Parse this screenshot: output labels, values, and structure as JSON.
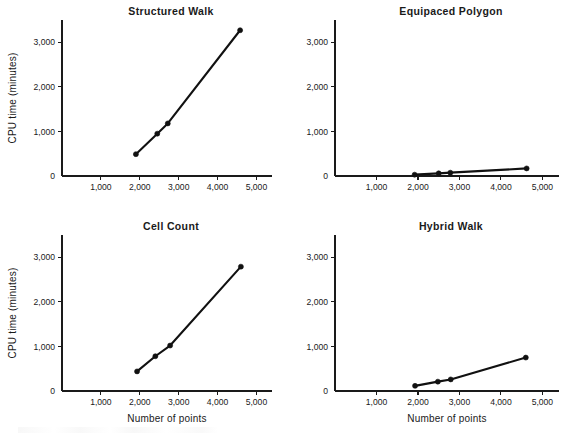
{
  "figure": {
    "background_color": "#ffffff",
    "ink_color": "#111111",
    "panel_count": 4
  },
  "chart_data": [
    {
      "type": "line",
      "title": "Structured Walk",
      "xlabel": "",
      "ylabel": "CPU time (minutes)",
      "xlim": [
        0,
        5400
      ],
      "ylim": [
        0,
        3500
      ],
      "xticks": [
        1000,
        2000,
        3000,
        4000,
        5000
      ],
      "xticklabels": [
        "1,000",
        "2,000",
        "3,000",
        "4,000",
        "5,000"
      ],
      "yticks": [
        0,
        1000,
        2000,
        3000
      ],
      "yticklabels": [
        "0",
        "1,000",
        "2,000",
        "3,000"
      ],
      "grid": false,
      "legend": false,
      "marker": "filled-circle",
      "x": [
        1900,
        2450,
        2720,
        4580
      ],
      "y": [
        490,
        950,
        1180,
        3270
      ]
    },
    {
      "type": "line",
      "title": "Equipaced Polygon",
      "xlabel": "",
      "ylabel": "",
      "xlim": [
        0,
        5400
      ],
      "ylim": [
        0,
        3500
      ],
      "xticks": [
        1000,
        2000,
        3000,
        4000,
        5000
      ],
      "xticklabels": [
        "1,000",
        "2,000",
        "3,000",
        "4,000",
        "5,000"
      ],
      "yticks": [
        0,
        1000,
        2000,
        3000
      ],
      "yticklabels": [
        "0",
        "1,000",
        "2,000",
        "3,000"
      ],
      "grid": false,
      "legend": false,
      "marker": "filled-circle",
      "x": [
        1920,
        2500,
        2780,
        4620
      ],
      "y": [
        30,
        60,
        75,
        170
      ]
    },
    {
      "type": "line",
      "title": "Cell Count",
      "xlabel": "Number of points",
      "ylabel": "CPU time (minutes)",
      "xlim": [
        0,
        5400
      ],
      "ylim": [
        0,
        3500
      ],
      "xticks": [
        1000,
        2000,
        3000,
        4000,
        5000
      ],
      "xticklabels": [
        "1,000",
        "2,000",
        "3,000",
        "4,000",
        "5,000"
      ],
      "yticks": [
        0,
        1000,
        2000,
        3000
      ],
      "yticklabels": [
        "0",
        "1,000",
        "2,000",
        "3,000"
      ],
      "grid": false,
      "legend": false,
      "marker": "filled-circle",
      "x": [
        1930,
        2400,
        2780,
        4600
      ],
      "y": [
        440,
        780,
        1020,
        2790
      ]
    },
    {
      "type": "line",
      "title": "Hybrid Walk",
      "xlabel": "Number of points",
      "ylabel": "",
      "xlim": [
        0,
        5400
      ],
      "ylim": [
        0,
        3500
      ],
      "xticks": [
        1000,
        2000,
        3000,
        4000,
        5000
      ],
      "xticklabels": [
        "1,000",
        "2,000",
        "3,000",
        "4,000",
        "5,000"
      ],
      "yticks": [
        0,
        1000,
        2000,
        3000
      ],
      "yticklabels": [
        "0",
        "1,000",
        "2,000",
        "3,000"
      ],
      "grid": false,
      "legend": false,
      "marker": "filled-circle",
      "x": [
        1930,
        2480,
        2790,
        4600
      ],
      "y": [
        115,
        210,
        260,
        750
      ]
    }
  ]
}
